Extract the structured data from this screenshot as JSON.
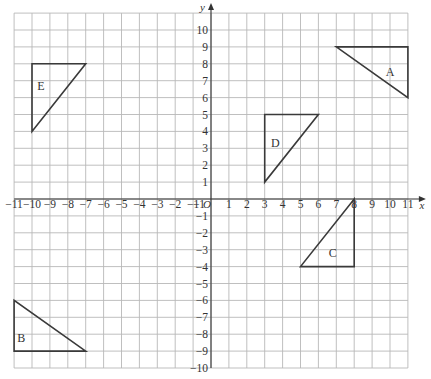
{
  "diagram": {
    "type": "coordinate-grid",
    "x_axis": {
      "name": "x",
      "min": -11,
      "max": 11,
      "ticks": [
        -11,
        -10,
        -9,
        -8,
        -7,
        -6,
        -5,
        -4,
        -3,
        -2,
        -1,
        1,
        2,
        3,
        4,
        5,
        6,
        7,
        8,
        9,
        10,
        11
      ]
    },
    "y_axis": {
      "name": "y",
      "min": -10,
      "max": 11,
      "ticks": [
        10,
        9,
        8,
        7,
        6,
        5,
        4,
        3,
        2,
        1,
        -1,
        -2,
        -3,
        -4,
        -5,
        -6,
        -7,
        -8,
        -9,
        -10
      ]
    },
    "origin_label": "O",
    "origin_x_label": "1",
    "shapes": [
      {
        "label": "A",
        "vertices": [
          [
            7,
            9
          ],
          [
            11,
            9
          ],
          [
            11,
            6
          ]
        ],
        "label_pos": [
          10,
          7.5
        ]
      },
      {
        "label": "B",
        "vertices": [
          [
            -11,
            -6
          ],
          [
            -11,
            -9
          ],
          [
            -7,
            -9
          ]
        ],
        "label_pos": [
          -10.6,
          -8.2
        ]
      },
      {
        "label": "C",
        "vertices": [
          [
            8,
            0
          ],
          [
            8,
            -4
          ],
          [
            5,
            -4
          ]
        ],
        "label_pos": [
          6.8,
          -3.2
        ]
      },
      {
        "label": "D",
        "vertices": [
          [
            3,
            5
          ],
          [
            6,
            5
          ],
          [
            3,
            1
          ]
        ],
        "label_pos": [
          3.6,
          3.3
        ]
      },
      {
        "label": "E",
        "vertices": [
          [
            -10,
            8
          ],
          [
            -7,
            8
          ],
          [
            -10,
            4
          ]
        ],
        "label_pos": [
          -9.5,
          6.7
        ]
      }
    ]
  }
}
